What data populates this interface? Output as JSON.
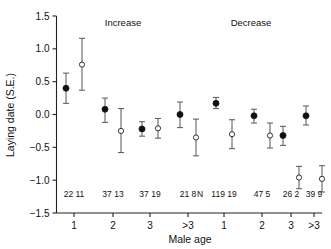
{
  "chart_data": {
    "type": "scatter",
    "title": "",
    "xlabel": "Male age",
    "ylabel": "Laying date (S.E.)",
    "ylim": [
      -1.5,
      1.5
    ],
    "yticks": [
      -1.5,
      -1.0,
      -0.5,
      0.0,
      0.5,
      1.0,
      1.5
    ],
    "ytick_labels": [
      "−1.5",
      "−1.0",
      "−0.5",
      "0.0",
      "0.5",
      "1.0",
      "1.5"
    ],
    "grid": false,
    "legend": "none",
    "group_labels": [
      "Increase",
      "Decrease"
    ],
    "n_row_header": "N",
    "categories": [
      "1",
      "2",
      "3",
      ">3",
      "1",
      "2",
      "3",
      ">3"
    ],
    "series": [
      {
        "name": "filled",
        "marker": "filled-circle",
        "color": "#111111",
        "values": [
          0.4,
          0.08,
          -0.22,
          0.0,
          0.17,
          -0.02,
          -0.32,
          -0.02
        ],
        "err_low": [
          0.17,
          -0.12,
          -0.33,
          -0.2,
          0.09,
          -0.13,
          -0.47,
          -0.16
        ],
        "err_high": [
          0.63,
          0.25,
          -0.11,
          0.19,
          0.26,
          0.08,
          -0.18,
          0.13
        ],
        "n": [
          22,
          37,
          37,
          21,
          119,
          47,
          26,
          39
        ]
      },
      {
        "name": "open",
        "marker": "open-circle",
        "color": "#ffffff",
        "values": [
          0.76,
          -0.25,
          -0.21,
          -0.35,
          -0.3,
          -0.32,
          -0.96,
          -0.98
        ],
        "err_low": [
          0.37,
          -0.58,
          -0.36,
          -0.63,
          -0.52,
          -0.51,
          -1.13,
          -1.18
        ],
        "err_high": [
          1.16,
          0.09,
          -0.06,
          -0.07,
          -0.08,
          -0.13,
          -0.79,
          -0.78
        ],
        "n": [
          11,
          13,
          19,
          8,
          19,
          5,
          2,
          9
        ]
      }
    ],
    "n_pairs": [
      "22 11",
      "37 13",
      "37 19",
      "21 8",
      "119 19",
      "47 5",
      "26 2",
      "39 9"
    ]
  }
}
